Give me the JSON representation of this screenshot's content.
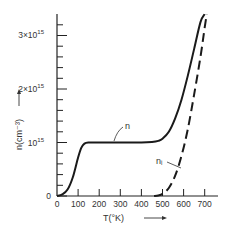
{
  "chart_data": {
    "type": "line",
    "title": "",
    "xlabel": "T(°K)",
    "ylabel": "n(cm⁻³)",
    "xlim": [
      0,
      730
    ],
    "ylim": [
      0,
      3400000000000000.0
    ],
    "x_ticks": [
      0,
      100,
      200,
      300,
      400,
      500,
      600,
      700
    ],
    "x_tick_labels": [
      "0",
      "100",
      "200",
      "300",
      "400",
      "500",
      "600",
      "700"
    ],
    "y_ticks": [
      0,
      1000000000000000.0,
      2000000000000000.0,
      3000000000000000.0
    ],
    "y_tick_labels": [
      "0",
      "10¹⁵",
      "2×10¹⁵",
      "3×10¹⁵"
    ],
    "y_minor_tick_step": 200000000000000.0,
    "grid": false,
    "legend": "inline annotations",
    "series": [
      {
        "name": "n",
        "style": "solid",
        "x": [
          0,
          25,
          50,
          75,
          100,
          115,
          130,
          150,
          200,
          300,
          400,
          450,
          480,
          500,
          530,
          560,
          590,
          620,
          650,
          680,
          700
        ],
        "y": [
          0,
          30000000000000.0,
          120000000000000.0,
          350000000000000.0,
          720000000000000.0,
          900000000000000.0,
          980000000000000.0,
          1000000000000000.0,
          1000000000000000.0,
          1000000000000000.0,
          1000000000000000.0,
          1010000000000000.0,
          1030000000000000.0,
          1070000000000000.0,
          1200000000000000.0,
          1450000000000000.0,
          1800000000000000.0,
          2250000000000000.0,
          2750000000000000.0,
          3250000000000000.0,
          3400000000000000.0
        ]
      },
      {
        "name": "n_i",
        "style": "dashed",
        "x": [
          460,
          480,
          500,
          530,
          560,
          590,
          620,
          650,
          680,
          700,
          710
        ],
        "y": [
          0,
          10000000000000.0,
          40000000000000.0,
          150000000000000.0,
          380000000000000.0,
          750000000000000.0,
          1250000000000000.0,
          1900000000000000.0,
          2600000000000000.0,
          3150000000000000.0,
          3400000000000000.0
        ]
      }
    ],
    "annotations": [
      {
        "text": "n",
        "target_series": "n",
        "x": 330,
        "y": 1000000000000000.0
      },
      {
        "text": "nᵢ",
        "target_series": "n_i",
        "x": 595,
        "y": 700000000000000.0
      },
      {
        "text": "→",
        "note": "arrow next to x-axis label"
      },
      {
        "text": "→",
        "note": "arrow next to y-axis label (pointing up)"
      }
    ]
  },
  "labels": {
    "xlabel": "T(°K)",
    "ylabel": "n(cm⁻³)",
    "n_label": "n",
    "ni_label": "nᵢ",
    "x_ticks": [
      "0",
      "100",
      "200",
      "300",
      "400",
      "500",
      "600",
      "700"
    ],
    "y0": "0",
    "y1": "10",
    "y1_exp": "15",
    "y2": "2×10",
    "y2_exp": "15",
    "y3": "3×10",
    "y3_exp": "15"
  }
}
